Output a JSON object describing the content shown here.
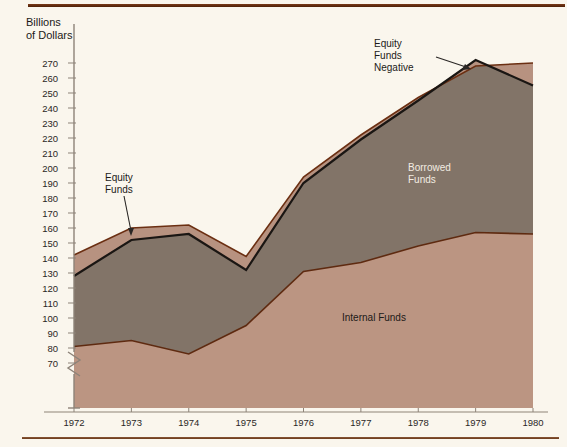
{
  "axis_title": "Billions\nof Dollars",
  "annotations": {
    "borrowed": "Borrowed\nFunds",
    "internal": "Internal Funds",
    "equity": "Equity\nFunds",
    "equity_negative": "Equity\nFunds\nNegative"
  },
  "colors": {
    "background": "#faf6ed",
    "internal_fill": "#bb9582",
    "borrowed_fill": "#827468",
    "equity_fill": "#b79280",
    "total_line": "#1a1613",
    "equity_line": "#6b2f12",
    "internal_line": "#5e2a10",
    "rule": "#6b2f12",
    "text": "#2a2725",
    "text_light": "#f2ece2"
  },
  "chart_data": {
    "type": "area",
    "title": "",
    "subtitle": "",
    "xlabel": "",
    "ylabel": "Billions of Dollars",
    "x": [
      1972,
      1973,
      1974,
      1975,
      1976,
      1977,
      1978,
      1979,
      1980
    ],
    "categories": [
      "1972",
      "1973",
      "1974",
      "1975",
      "1976",
      "1977",
      "1978",
      "1979",
      "1980"
    ],
    "ylim": [
      70,
      275
    ],
    "yticks": [
      70,
      80,
      90,
      100,
      110,
      120,
      130,
      140,
      150,
      160,
      170,
      180,
      190,
      200,
      210,
      220,
      230,
      240,
      250,
      260,
      270
    ],
    "ytick_labels": [
      "70",
      "80",
      "90",
      "100",
      "110",
      "120",
      "130",
      "140",
      "150",
      "160",
      "170",
      "180",
      "190",
      "200",
      "210",
      "220",
      "230",
      "240",
      "250",
      "260",
      "270"
    ],
    "axis_break": true,
    "axis_break_note": "y-axis broken below 70",
    "grid": false,
    "legend": "inline-labels",
    "stacked": true,
    "series": [
      {
        "name": "Internal Funds",
        "kind": "cumulative_boundary",
        "values": [
          81,
          85,
          76,
          95,
          131,
          137,
          148,
          157,
          156
        ],
        "fill": "#bb9582",
        "line": "#5e2a10"
      },
      {
        "name": "Borrowed Funds",
        "kind": "cumulative_boundary",
        "note": "upper boundary = Internal + Borrowed (heavy black line)",
        "values": [
          128,
          152,
          156,
          132,
          190,
          219,
          245,
          272,
          255
        ],
        "fill": "#827468",
        "line": "#1a1613"
      },
      {
        "name": "Equity Funds",
        "kind": "cumulative_boundary",
        "note": "total of all funds (thin brown line); dips below the black line at 1979 where equity funds are negative",
        "values": [
          142,
          160,
          162,
          141,
          194,
          222,
          247,
          268,
          270
        ],
        "fill": "#b79280",
        "line": "#6b2f12"
      }
    ]
  }
}
